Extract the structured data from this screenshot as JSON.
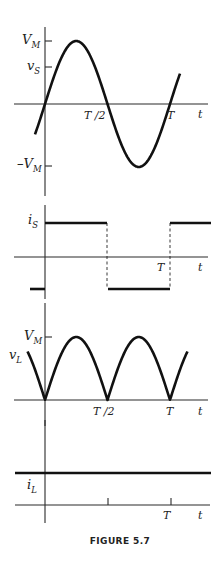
{
  "caption": "FIGURE 5.7",
  "chart_data": [
    {
      "type": "line",
      "name": "source-voltage",
      "ylabel": "v_S",
      "xlabel": "t",
      "y_ticks": [
        {
          "label": "V_M",
          "value": 1
        },
        {
          "label": "-V_M",
          "value": -1
        }
      ],
      "x_ticks": [
        {
          "label": "T/2",
          "value": 0.5
        },
        {
          "label": "T",
          "value": 1
        }
      ],
      "function": "V_M sin(2*pi*t/T)",
      "x": [
        -0.08,
        0,
        0.25,
        0.5,
        0.75,
        1,
        1.08
      ],
      "y": [
        -0.48,
        0,
        1,
        0,
        -1,
        0,
        0.48
      ]
    },
    {
      "type": "line",
      "name": "source-current",
      "ylabel": "i_S",
      "xlabel": "t",
      "x_ticks": [
        {
          "label": "T",
          "value": 1
        }
      ],
      "function": "square wave +I / -I",
      "x": [
        -0.24,
        0,
        0,
        0.5,
        0.5,
        1,
        1,
        1.33
      ],
      "y": [
        -1,
        -1,
        1,
        1,
        -1,
        -1,
        1,
        1
      ]
    },
    {
      "type": "line",
      "name": "load-voltage",
      "ylabel": "v_L",
      "xlabel": "t",
      "y_ticks": [
        {
          "label": "V_M",
          "value": 1
        }
      ],
      "x_ticks": [
        {
          "label": "T/2",
          "value": 0.5
        },
        {
          "label": "T",
          "value": 1
        }
      ],
      "function": "V_M |sin(2*pi*t/T)|",
      "x": [
        -0.14,
        0,
        0.25,
        0.5,
        0.75,
        1,
        1.14
      ],
      "y": [
        0.77,
        0,
        1,
        0,
        1,
        0,
        0.77
      ]
    },
    {
      "type": "line",
      "name": "load-current",
      "ylabel": "i_L",
      "xlabel": "t",
      "x_ticks": [
        {
          "label": "",
          "value": 0.5
        },
        {
          "label": "T",
          "value": 1
        }
      ],
      "function": "constant I",
      "x": [
        -0.48,
        1.33
      ],
      "y": [
        1,
        1
      ]
    }
  ],
  "labels": {
    "vm_top": "V",
    "vm_top_sub": "M",
    "vs": "v",
    "vs_sub": "S",
    "vm_neg": "–V",
    "vm_neg_sub": "M",
    "is": "i",
    "is_sub": "S",
    "vm_load": "V",
    "vm_load_sub": "M",
    "vl": "v",
    "vl_sub": "L",
    "il": "i",
    "il_sub": "L",
    "t_half": "T /2",
    "t_full": "T",
    "t_axis": "t"
  }
}
